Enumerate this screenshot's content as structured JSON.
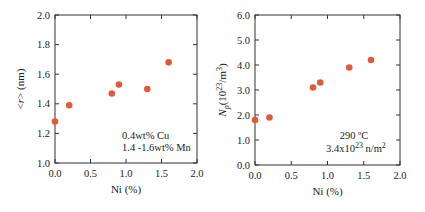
{
  "chart_data": [
    {
      "type": "scatter",
      "title": "",
      "xlabel": "Ni (%)",
      "ylabel": "<r> (nm)",
      "xlim": [
        0.0,
        2.0
      ],
      "ylim": [
        1.0,
        2.0
      ],
      "xticks": [
        "0.0",
        "0.5",
        "1.0",
        "1.5",
        "2.0"
      ],
      "yticks": [
        "1.0",
        "1.2",
        "1.4",
        "1.6",
        "1.8",
        "2.0"
      ],
      "grid": false,
      "legend": null,
      "annotations": [
        "0.4wt% Cu",
        "1.4 -1.6wt% Mn"
      ],
      "series": [
        {
          "name": "<r>",
          "color": "#e05a3a",
          "x": [
            0.0,
            0.2,
            0.8,
            0.9,
            1.3,
            1.6
          ],
          "y": [
            1.28,
            1.39,
            1.47,
            1.53,
            1.5,
            1.68
          ]
        }
      ]
    },
    {
      "type": "scatter",
      "title": "",
      "xlabel": "Ni (%)",
      "ylabel": "Np (10^23/m^3)",
      "xlim": [
        0.0,
        2.0
      ],
      "ylim": [
        0.0,
        6.0
      ],
      "xticks": [
        "0.0",
        "0.5",
        "1.0",
        "1.5",
        "2.0"
      ],
      "yticks": [
        "0.0",
        "1.0",
        "2.0",
        "3.0",
        "4.0",
        "5.0",
        "6.0"
      ],
      "grid": false,
      "legend": null,
      "annotations": [
        "290 ºC",
        "3.4x10^23 n/m^2"
      ],
      "series": [
        {
          "name": "Np",
          "color": "#e05a3a",
          "x": [
            0.0,
            0.2,
            0.8,
            0.9,
            1.3,
            1.6
          ],
          "y": [
            1.8,
            1.9,
            3.1,
            3.3,
            3.9,
            4.2
          ]
        }
      ]
    }
  ],
  "labels": {
    "left_y_prefix": "<",
    "left_y_var": "r",
    "left_y_suffix": "> (nm)",
    "right_y_var": "N",
    "right_y_sub": "p",
    "right_y_open": "(10",
    "right_y_exp": "23",
    "right_y_mid": "/m",
    "right_y_exp2": "3",
    "right_y_close": ")",
    "right_ann1": "290 ºC",
    "right_ann2_base": "3.4x10",
    "right_ann2_exp": "23",
    "right_ann2_unit": " n/m",
    "right_ann2_unit_exp": "2"
  }
}
